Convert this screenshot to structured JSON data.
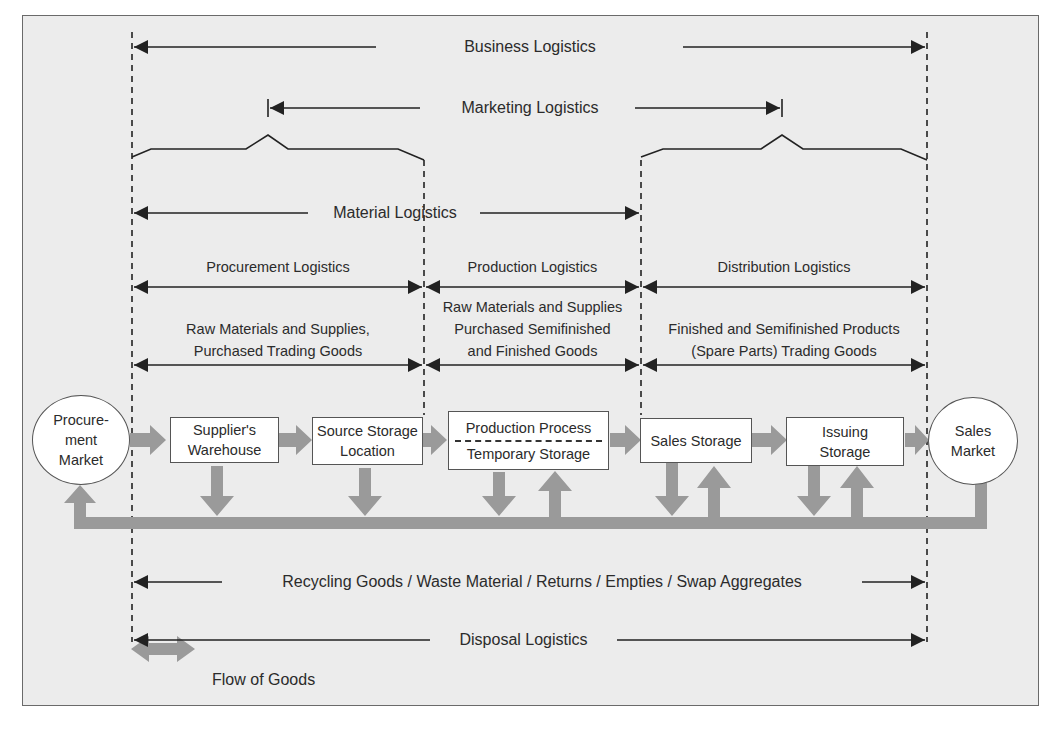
{
  "diagram": {
    "title_spans": {
      "business_logistics": "Business Logistics",
      "marketing_logistics": "Marketing Logistics",
      "material_logistics": "Material Logistics",
      "procurement_logistics": "Procurement Logistics",
      "production_logistics": "Production Logistics",
      "distribution_logistics": "Distribution Logistics",
      "recycling_span": "Recycling Goods / Waste Material / Returns / Empties / Swap Aggregates",
      "disposal_logistics": "Disposal Logistics"
    },
    "goods_descriptions": {
      "procurement_line1": "Raw Materials and Supplies,",
      "procurement_line2": "Purchased Trading Goods",
      "production_line1": "Raw Materials and Supplies",
      "production_line2": "Purchased Semifinished",
      "production_line3": "and Finished Goods",
      "distribution_line1": "Finished and Semifinished Products",
      "distribution_line2": "(Spare Parts) Trading Goods"
    },
    "nodes": {
      "procurement_market": {
        "line1": "Procure-",
        "line2": "ment",
        "line3": "Market"
      },
      "suppliers_warehouse": {
        "line1": "Supplier's",
        "line2": "Warehouse"
      },
      "source_storage": {
        "line1": "Source Storage",
        "line2": "Location"
      },
      "production": {
        "top": "Production Process",
        "bottom": "Temporary Storage"
      },
      "sales_storage": {
        "line1": "Sales Storage"
      },
      "issuing_storage": {
        "line1": "Issuing",
        "line2": "Storage"
      },
      "sales_market": {
        "line1": "Sales",
        "line2": "Market"
      }
    },
    "legend": {
      "flow_of_goods": "Flow of Goods"
    },
    "colors": {
      "background": "#ececec",
      "flow_arrow": "#9a9a9a",
      "line": "#222222",
      "box_fill": "#ffffff"
    }
  }
}
